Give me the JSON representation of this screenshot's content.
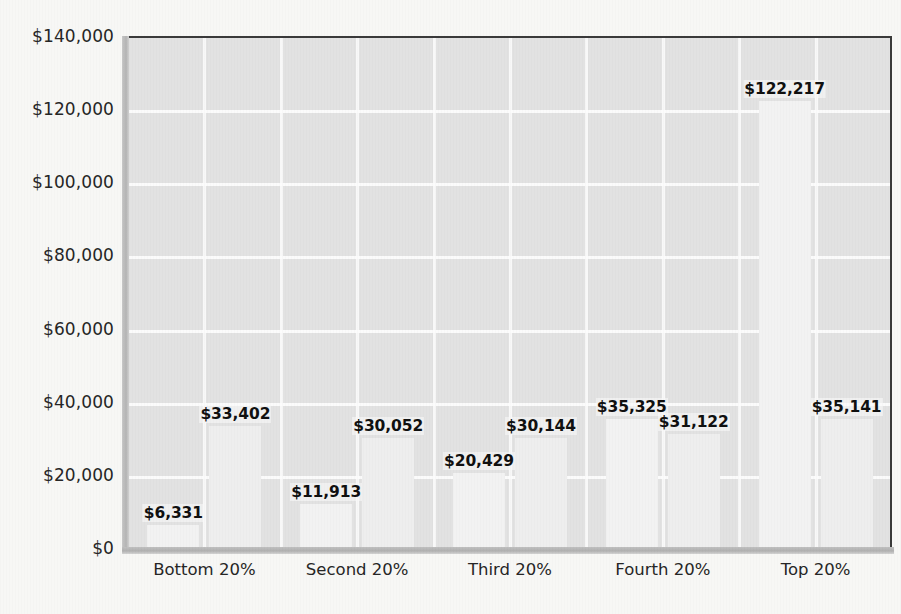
{
  "chart_data": {
    "type": "bar",
    "title": "",
    "subtitle": "",
    "xlabel": "",
    "ylabel": "",
    "categories": [
      "Bottom 20%",
      "Second 20%",
      "Third 20%",
      "Fourth 20%",
      "Top 20%"
    ],
    "series": [
      {
        "name": "Series 1",
        "values": [
          6331,
          11913,
          20429,
          35325,
          122217
        ]
      },
      {
        "name": "Series 2",
        "values": [
          33402,
          30052,
          30144,
          31122,
          35141
        ]
      }
    ],
    "bars": [
      {
        "category": "Bottom 20%",
        "series": "Series 1",
        "value": 6331,
        "label": "$6,331"
      },
      {
        "category": "Bottom 20%",
        "series": "Series 2",
        "value": 33402,
        "label": "$33,402"
      },
      {
        "category": "Second 20%",
        "series": "Series 1",
        "value": 11913,
        "label": "$11,913"
      },
      {
        "category": "Second 20%",
        "series": "Series 2",
        "value": 30052,
        "label": "$30,052"
      },
      {
        "category": "Third 20%",
        "series": "Series 1",
        "value": 20429,
        "label": "$20,429"
      },
      {
        "category": "Third 20%",
        "series": "Series 2",
        "value": 30144,
        "label": "$30,144"
      },
      {
        "category": "Fourth 20%",
        "series": "Series 1",
        "value": 35325,
        "label": "$35,325"
      },
      {
        "category": "Fourth 20%",
        "series": "Series 2",
        "value": 31122,
        "label": "$31,122"
      },
      {
        "category": "Top 20%",
        "series": "Series 1",
        "value": 122217,
        "label": "$122,217"
      },
      {
        "category": "Top 20%",
        "series": "Series 2",
        "value": 35141,
        "label": "$35,141"
      }
    ],
    "ylim": [
      0,
      140000
    ],
    "ytick_values": [
      0,
      20000,
      40000,
      60000,
      80000,
      100000,
      120000,
      140000
    ],
    "ytick_labels": [
      "$0",
      "$20,000",
      "$40,000",
      "$60,000",
      "$80,000",
      "$100,000",
      "$120,000",
      "$140,000"
    ],
    "grid": true,
    "grid_orientation": "both",
    "legend": "none",
    "colors": {
      "plot_background": "#e2e2e2",
      "gridline": "#fbfbfb",
      "bar_fill": "#f2f2f2",
      "axis_line": "#3a3a3a",
      "label_text": "#101010",
      "page_background": "#f7f7f5"
    }
  }
}
